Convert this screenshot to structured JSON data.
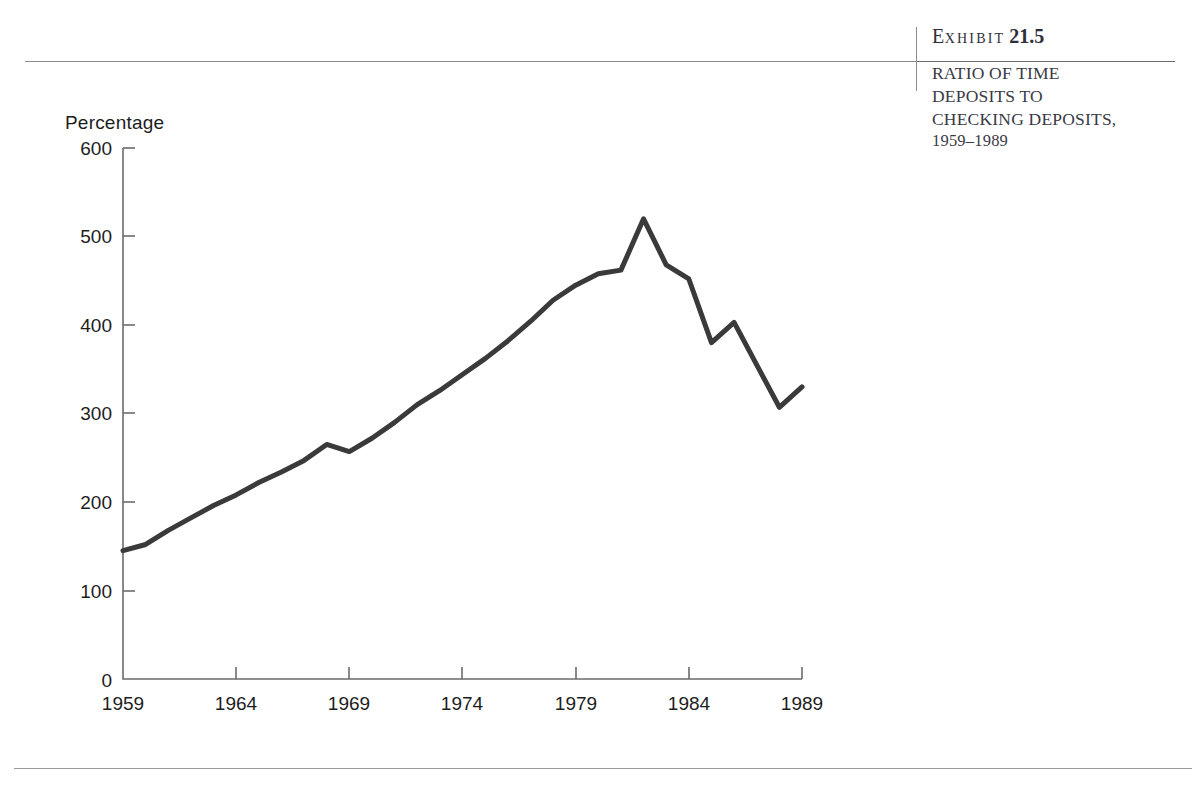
{
  "exhibit": {
    "label_lead": "E",
    "label_rest": "XHIBIT",
    "number": "21.5",
    "caption_line1": "RATIO OF TIME",
    "caption_line2": "DEPOSITS TO",
    "caption_line3": "CHECKING DEPOSITS,",
    "caption_line4": "1959–1989"
  },
  "chart_data": {
    "type": "line",
    "title": "RATIO OF TIME DEPOSITS TO CHECKING DEPOSITS, 1959–1989",
    "xlabel": "",
    "ylabel": "Percentage",
    "ylim": [
      0,
      600
    ],
    "xlim": [
      1959,
      1989
    ],
    "grid": false,
    "legend": "none",
    "line_color": "#3a3a3a",
    "ytick_labels": [
      "600",
      "500",
      "400",
      "300",
      "200",
      "100",
      "0"
    ],
    "ytick_values": [
      600,
      500,
      400,
      300,
      200,
      100,
      0
    ],
    "xtick_labels": [
      "1959",
      "1964",
      "1969",
      "1974",
      "1979",
      "1984",
      "1989"
    ],
    "xtick_values": [
      1959,
      1964,
      1969,
      1974,
      1979,
      1984,
      1989
    ],
    "x": [
      1959,
      1960,
      1961,
      1962,
      1963,
      1964,
      1965,
      1966,
      1967,
      1968,
      1969,
      1970,
      1971,
      1972,
      1973,
      1974,
      1975,
      1976,
      1977,
      1978,
      1979,
      1980,
      1981,
      1982,
      1983,
      1984,
      1985,
      1986,
      1987,
      1988,
      1989
    ],
    "values": [
      145,
      152,
      168,
      182,
      196,
      208,
      222,
      234,
      247,
      265,
      257,
      272,
      290,
      310,
      326,
      344,
      362,
      382,
      404,
      428,
      445,
      458,
      462,
      520,
      468,
      452,
      380,
      403,
      355,
      307,
      330
    ],
    "series_name": "Ratio of time deposits to checking deposits"
  }
}
